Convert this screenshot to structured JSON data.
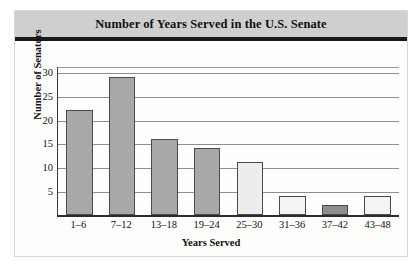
{
  "chart_data": {
    "type": "bar",
    "title": "Number of Years Served in the U.S. Senate",
    "xlabel": "Years Served",
    "ylabel": "Number of Senators",
    "categories": [
      "1–6",
      "7–12",
      "13–18",
      "19–24",
      "25–30",
      "31–36",
      "37–42",
      "43–48"
    ],
    "values": [
      22,
      29,
      16,
      14,
      11,
      4,
      2,
      4
    ],
    "ylim": [
      0,
      31
    ],
    "yticks": [
      5,
      10,
      15,
      20,
      25,
      30
    ],
    "ytick_labels": [
      "5",
      "10",
      "15",
      "20",
      "25",
      "30"
    ],
    "grid": true,
    "legend": null,
    "bar_colors": [
      "#a8a8a8",
      "#a8a8a8",
      "#a8a8a8",
      "#a8a8a8",
      "#ededed",
      "#f4f4f4",
      "#8e8e8e",
      "#f4f4f4"
    ]
  },
  "style": {
    "title_band_color": "#cfcfcf",
    "title_rule_color": "#1a1a1a",
    "plot_background": "#fefefe",
    "gridline_color": "#8e8e8e",
    "axis_color": "#2c2c2c",
    "bar_border_color": "#4a4a4a",
    "text_color": "#111111"
  }
}
